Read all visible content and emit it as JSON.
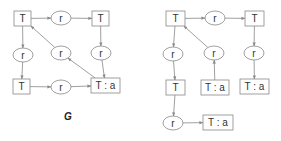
{
  "diagrams": [
    {
      "name": "G",
      "label": "G",
      "nodes": [
        {
          "id": "t1",
          "type": "box",
          "text": "T",
          "x": 14,
          "y": 11,
          "w": 17,
          "h": 15
        },
        {
          "id": "r1",
          "type": "ellipse",
          "text": "r",
          "cx": 61,
          "cy": 18,
          "rx": 10,
          "ry": 7
        },
        {
          "id": "t2",
          "type": "box",
          "text": "T",
          "x": 92,
          "y": 11,
          "w": 17,
          "h": 15
        },
        {
          "id": "r2",
          "type": "ellipse",
          "text": "r",
          "cx": 23,
          "cy": 55,
          "rx": 10,
          "ry": 7
        },
        {
          "id": "r3",
          "type": "ellipse",
          "text": "r",
          "cx": 61,
          "cy": 53,
          "rx": 10,
          "ry": 7
        },
        {
          "id": "r4",
          "type": "ellipse",
          "text": "r",
          "cx": 101,
          "cy": 53,
          "rx": 10,
          "ry": 7
        },
        {
          "id": "t3",
          "type": "box",
          "text": "T",
          "x": 13,
          "y": 79,
          "w": 17,
          "h": 15
        },
        {
          "id": "r5",
          "type": "ellipse",
          "text": "r",
          "cx": 61,
          "cy": 87,
          "rx": 10,
          "ry": 7
        },
        {
          "id": "t4",
          "type": "box",
          "text": "T : a",
          "x": 91,
          "y": 78,
          "w": 29,
          "h": 15
        }
      ],
      "edges": [
        [
          "t1",
          "r1"
        ],
        [
          "r1",
          "t2"
        ],
        [
          "t1",
          "r2"
        ],
        [
          "r2",
          "t3"
        ],
        [
          "t3",
          "r5"
        ],
        [
          "r5",
          "t4"
        ],
        [
          "t2",
          "r4"
        ],
        [
          "r4",
          "t4"
        ],
        [
          "t4",
          "r3"
        ],
        [
          "r3",
          "t1"
        ]
      ]
    },
    {
      "name": "right",
      "label": "",
      "nodes": [
        {
          "id": "u1",
          "type": "box",
          "text": "T",
          "x": 166,
          "y": 11,
          "w": 19,
          "h": 15
        },
        {
          "id": "s1",
          "type": "ellipse",
          "text": "r",
          "cx": 215,
          "cy": 18,
          "rx": 10,
          "ry": 7
        },
        {
          "id": "u2",
          "type": "box",
          "text": "T",
          "x": 245,
          "y": 11,
          "w": 19,
          "h": 15
        },
        {
          "id": "s2",
          "type": "ellipse",
          "text": "r",
          "cx": 173,
          "cy": 54,
          "rx": 10,
          "ry": 7
        },
        {
          "id": "s3",
          "type": "ellipse",
          "text": "r",
          "cx": 214,
          "cy": 53,
          "rx": 10,
          "ry": 7
        },
        {
          "id": "s4",
          "type": "ellipse",
          "text": "r",
          "cx": 254,
          "cy": 53,
          "rx": 10,
          "ry": 7
        },
        {
          "id": "u3",
          "type": "box",
          "text": "T",
          "x": 166,
          "y": 80,
          "w": 19,
          "h": 15
        },
        {
          "id": "u4",
          "type": "box",
          "text": "T : a",
          "x": 201,
          "y": 80,
          "w": 28,
          "h": 15
        },
        {
          "id": "u5",
          "type": "box",
          "text": "T : a",
          "x": 240,
          "y": 79,
          "w": 29,
          "h": 15
        },
        {
          "id": "s5",
          "type": "ellipse",
          "text": "r",
          "cx": 173,
          "cy": 123,
          "rx": 10,
          "ry": 7
        },
        {
          "id": "u6",
          "type": "box",
          "text": "T : a",
          "x": 203,
          "y": 115,
          "w": 30,
          "h": 15
        }
      ],
      "edges": [
        [
          "u1",
          "s1"
        ],
        [
          "s1",
          "u2"
        ],
        [
          "u1",
          "s2"
        ],
        [
          "s2",
          "u3"
        ],
        [
          "u3",
          "s5"
        ],
        [
          "s5",
          "u6"
        ],
        [
          "u2",
          "s4"
        ],
        [
          "s4",
          "u5"
        ],
        [
          "u4",
          "s3"
        ],
        [
          "s3",
          "u1"
        ]
      ]
    }
  ],
  "colors": {
    "stroke": "#888888",
    "text": "#333333",
    "background": "#ffffff"
  }
}
